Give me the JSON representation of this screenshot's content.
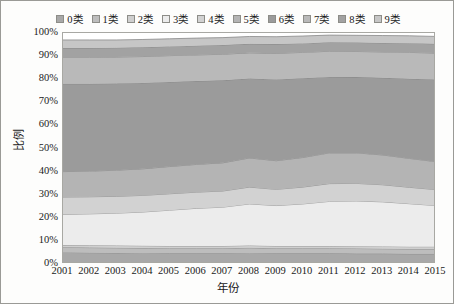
{
  "chart_data": {
    "type": "area",
    "stacked": true,
    "title": "",
    "xlabel": "年份",
    "ylabel": "比例",
    "x": [
      2001,
      2002,
      2003,
      2004,
      2005,
      2006,
      2007,
      2008,
      2009,
      2010,
      2011,
      2012,
      2013,
      2014,
      2015
    ],
    "xtick_labels": [
      "2001",
      "2002",
      "2003",
      "2004",
      "2005",
      "2006",
      "2007",
      "2008",
      "2009",
      "2010",
      "2011",
      "2012",
      "2013",
      "2014",
      "2015"
    ],
    "ylim": [
      0,
      100
    ],
    "ytick_labels": [
      "0%",
      "10%",
      "20%",
      "30%",
      "40%",
      "50%",
      "60%",
      "70%",
      "80%",
      "90%",
      "100%"
    ],
    "ytick_values": [
      0,
      10,
      20,
      30,
      40,
      50,
      60,
      70,
      80,
      90,
      100
    ],
    "grid": false,
    "legend_position": "top",
    "legend_labels": [
      "0类",
      "1类",
      "2类",
      "3类",
      "4类",
      "5类",
      "6类",
      "7类",
      "8类",
      "9类"
    ],
    "series": [
      {
        "name": "0类",
        "color": "#a8a8a8",
        "values": [
          5.0,
          4.9,
          4.8,
          4.7,
          4.6,
          4.6,
          4.6,
          4.7,
          4.6,
          4.6,
          4.6,
          4.5,
          4.5,
          4.4,
          4.4
        ]
      },
      {
        "name": "1类",
        "color": "#bdbdbd",
        "values": [
          2.2,
          2.2,
          2.2,
          2.2,
          2.2,
          2.2,
          2.2,
          2.3,
          2.2,
          2.2,
          2.2,
          2.2,
          2.1,
          2.1,
          2.1
        ]
      },
      {
        "name": "2类",
        "color": "#cfcfcf",
        "values": [
          1.0,
          1.0,
          1.0,
          1.0,
          1.0,
          1.0,
          1.0,
          1.0,
          1.0,
          1.0,
          1.0,
          1.0,
          1.0,
          1.0,
          1.0
        ]
      },
      {
        "name": "3类",
        "color": "#ececec",
        "values": [
          13.3,
          13.6,
          14.0,
          14.6,
          15.5,
          16.3,
          16.8,
          18.0,
          17.5,
          18.2,
          19.3,
          19.6,
          19.3,
          18.6,
          17.8
        ]
      },
      {
        "name": "4类",
        "color": "#d2d2d2",
        "values": [
          7.5,
          7.4,
          7.3,
          7.2,
          7.1,
          7.0,
          7.0,
          7.3,
          7.0,
          7.3,
          7.7,
          7.6,
          7.4,
          7.1,
          6.9
        ]
      },
      {
        "name": "5类",
        "color": "#b4b4b4",
        "values": [
          11.0,
          11.1,
          11.3,
          11.5,
          11.8,
          12.0,
          12.2,
          12.6,
          12.4,
          12.8,
          13.3,
          13.2,
          12.9,
          12.5,
          12.1
        ]
      },
      {
        "name": "6类",
        "color": "#9b9b9b",
        "values": [
          38.0,
          37.8,
          37.5,
          37.2,
          36.6,
          36.1,
          35.7,
          34.4,
          35.2,
          34.3,
          32.9,
          32.8,
          33.4,
          34.5,
          35.5
        ]
      },
      {
        "name": "7类",
        "color": "#b9b9b9",
        "values": [
          11.5,
          11.5,
          11.5,
          11.4,
          11.4,
          11.3,
          11.3,
          11.1,
          11.3,
          11.2,
          11.1,
          11.1,
          11.2,
          11.4,
          11.5
        ]
      },
      {
        "name": "8类",
        "color": "#a2a2a2",
        "values": [
          4.0,
          4.0,
          4.0,
          4.0,
          4.0,
          4.0,
          4.0,
          3.9,
          4.0,
          3.9,
          3.9,
          3.9,
          3.9,
          4.0,
          4.0
        ]
      },
      {
        "name": "9类",
        "color": "#c6c6c6",
        "values": [
          3.5,
          3.5,
          3.4,
          3.4,
          3.3,
          3.3,
          3.2,
          3.2,
          3.2,
          3.2,
          3.1,
          3.1,
          3.2,
          3.2,
          3.2
        ]
      }
    ]
  }
}
